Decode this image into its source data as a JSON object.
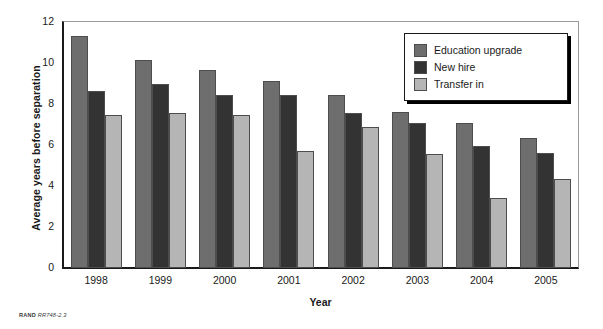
{
  "chart_data": {
    "type": "bar",
    "title": "",
    "xlabel": "Year",
    "ylabel": "Average years before separation",
    "categories": [
      "1998",
      "1999",
      "2000",
      "2001",
      "2002",
      "2003",
      "2004",
      "2005"
    ],
    "series": [
      {
        "name": "Education upgrade",
        "color": "#6e6e6e",
        "values": [
          11.3,
          10.15,
          9.65,
          9.1,
          8.45,
          7.6,
          7.05,
          6.35
        ]
      },
      {
        "name": "New hire",
        "color": "#333333",
        "values": [
          8.65,
          9.0,
          8.45,
          8.45,
          7.55,
          7.05,
          5.95,
          5.6
        ]
      },
      {
        "name": "Transfer in",
        "color": "#b5b5b5",
        "values": [
          7.45,
          7.55,
          7.45,
          5.7,
          6.9,
          5.55,
          3.4,
          4.35
        ]
      }
    ],
    "ylim": [
      0,
      12
    ],
    "yticks": [
      "0",
      "2",
      "4",
      "6",
      "8",
      "10",
      "12"
    ],
    "ytick_values": [
      0,
      2,
      4,
      6,
      8,
      10,
      12
    ],
    "grid": false,
    "legend_position": "top-right"
  },
  "legend": {
    "entries": [
      {
        "label": "Education upgrade",
        "color": "#6e6e6e"
      },
      {
        "label": "New hire",
        "color": "#333333"
      },
      {
        "label": "Transfer in",
        "color": "#b5b5b5"
      }
    ]
  },
  "footnote": {
    "source": "RAND",
    "code": "RR748-2.3"
  }
}
